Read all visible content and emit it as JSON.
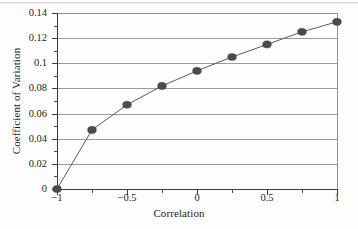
{
  "chart_data": {
    "type": "line",
    "title": "",
    "xlabel": "Correlation",
    "ylabel": "Coefficient of Variation",
    "xlim": [
      -1,
      1
    ],
    "ylim": [
      0,
      0.14
    ],
    "grid": true,
    "legend": null,
    "marker": "filled-circle",
    "marker_color": "#4b4b4b",
    "line_color": "#5a5a5a",
    "x": [
      -1,
      -0.75,
      -0.5,
      -0.25,
      0,
      0.25,
      0.5,
      0.75,
      1
    ],
    "values": [
      0,
      0.047,
      0.067,
      0.082,
      0.094,
      0.105,
      0.115,
      0.125,
      0.133
    ],
    "series": [
      {
        "name": "Coefficient of Variation",
        "x": [
          -1,
          -0.75,
          -0.5,
          -0.25,
          0,
          0.25,
          0.5,
          0.75,
          1
        ],
        "values": [
          0,
          0.047,
          0.067,
          0.082,
          0.094,
          0.105,
          0.115,
          0.125,
          0.133
        ]
      }
    ],
    "xticks": [
      -1,
      -0.5,
      0,
      0.5,
      1
    ],
    "xtick_labels": [
      "−1",
      "−0.5",
      "0",
      "0.5",
      "1"
    ],
    "xticks_minor": [
      -0.75,
      -0.25,
      0.25,
      0.75
    ],
    "yticks": [
      0,
      0.02,
      0.04,
      0.06,
      0.08,
      0.1,
      0.12,
      0.14
    ],
    "ytick_labels": [
      "0",
      "0.02",
      "0.04",
      "0.06",
      "0.08",
      "0.1",
      "0.12",
      "0.14"
    ],
    "yticks_minor": [
      0.01,
      0.03,
      0.05,
      0.07,
      0.09,
      0.11,
      0.13
    ]
  },
  "axes": {
    "x_title": "Correlation",
    "y_title": "Coefficient of Variation"
  }
}
